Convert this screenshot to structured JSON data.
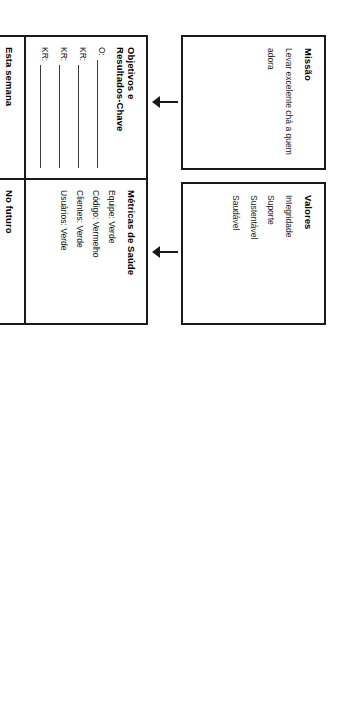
{
  "page": {
    "orientation": "landscape-rotated-90",
    "background_color": "#ffffff",
    "border_color": "#1a1a1a",
    "shaded_cell_color": "#a8a8a8"
  },
  "mission": {
    "title": "Missão",
    "lines": [
      "Levar excelente chá a quem",
      "adora"
    ]
  },
  "values": {
    "title": "Valores",
    "items": [
      "Integridade",
      "Suporte",
      "Sustentável",
      "Saudável"
    ]
  },
  "okr": {
    "title_line1": "Objetivos e",
    "title_line2": "Resultados-Chave",
    "rows": [
      "O:",
      "KR:",
      "KR:",
      "KR:"
    ]
  },
  "health": {
    "title": "Métricas de Saúde",
    "metrics": [
      "Equipe: Verde",
      "Código: Vermelho",
      "Clientes: Verde",
      "Usuários: Verde"
    ]
  },
  "this_week": {
    "title": "Esta semana",
    "blank_line_count": 6
  },
  "future": {
    "title": "No futuro",
    "blank_line_count": 0
  },
  "pipeline": {
    "title": "PIPELINE",
    "row_labels": [
      "Resultado",
      "Confiança",
      "Esforço",
      "Impacto",
      "Projeto"
    ],
    "column_count": 11,
    "shaded_row_label": "Resultado"
  },
  "arrows": {
    "mission_to_okr": "arrow-down",
    "values_to_health": "arrow-down",
    "pipeline_to_week": "arrow-up"
  }
}
